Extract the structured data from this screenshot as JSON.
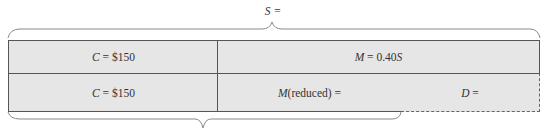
{
  "diagram": {
    "top_brace": {
      "label": "S ="
    },
    "row1": [
      {
        "label": "C = $150",
        "var": "C",
        "rest": " = $150"
      },
      {
        "label": "M = 0.40S",
        "var": "M",
        "rest": " = 0.40",
        "tail": "S"
      }
    ],
    "row2": [
      {
        "label": "C = $150",
        "var": "C",
        "rest": " = $150"
      },
      {
        "label": "M(reduced) =",
        "var": "M",
        "rest": "(reduced) ="
      },
      {
        "label": "D =",
        "var": "D",
        "rest": " =",
        "style": "dashed"
      }
    ],
    "bottom_brace": {
      "label": ""
    },
    "colors": {
      "fill": "#e6e6e6",
      "border": "#555555",
      "brace": "#888888"
    }
  }
}
